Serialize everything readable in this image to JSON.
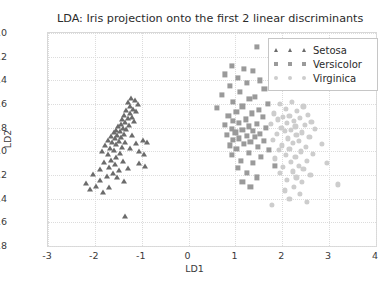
{
  "chart_data": {
    "type": "scatter",
    "title": "LDA: Iris projection onto the first 2 linear discriminants",
    "xlabel": "LD1",
    "ylabel": "LD2",
    "xlim": [
      -3,
      4
    ],
    "ylim": [
      -2.8,
      -1.0
    ],
    "xticks": [
      "-3",
      "-2",
      "-1",
      "0",
      "1",
      "2",
      "3",
      "4"
    ],
    "xtick_values": [
      -3,
      -2,
      -1,
      0,
      1,
      2,
      3,
      4
    ],
    "yticks": [
      "-1.0",
      "-1.2",
      "-1.4",
      "-1.6",
      "-1.8",
      "-2.0",
      "-2.2",
      "-2.4",
      "-2.6",
      "-2.8"
    ],
    "ytick_values": [
      -1.0,
      -1.2,
      -1.4,
      -1.6,
      -1.8,
      -2.0,
      -2.2,
      -2.4,
      -2.6,
      -2.8
    ],
    "grid": true,
    "legend_position": "top-right",
    "background_color": "#ffffff",
    "series": [
      {
        "name": "Setosa",
        "marker": "triangle",
        "color": "#6b6b6b",
        "points": [
          [
            -1.22,
            -1.55
          ],
          [
            -1.15,
            -1.57
          ],
          [
            -1.3,
            -1.58
          ],
          [
            -1.08,
            -1.6
          ],
          [
            -1.26,
            -1.62
          ],
          [
            -1.18,
            -1.64
          ],
          [
            -1.33,
            -1.65
          ],
          [
            -1.12,
            -1.66
          ],
          [
            -1.24,
            -1.68
          ],
          [
            -1.38,
            -1.69
          ],
          [
            -1.2,
            -1.71
          ],
          [
            -1.29,
            -1.72
          ],
          [
            -1.42,
            -1.73
          ],
          [
            -1.16,
            -1.74
          ],
          [
            -1.35,
            -1.75
          ],
          [
            -1.45,
            -1.77
          ],
          [
            -1.27,
            -1.78
          ],
          [
            -1.5,
            -1.79
          ],
          [
            -1.4,
            -1.8
          ],
          [
            -1.33,
            -1.81
          ],
          [
            -1.55,
            -1.82
          ],
          [
            -1.46,
            -1.83
          ],
          [
            -1.6,
            -1.84
          ],
          [
            -1.38,
            -1.85
          ],
          [
            -1.52,
            -1.86
          ],
          [
            -1.21,
            -1.86
          ],
          [
            -1.66,
            -1.87
          ],
          [
            -1.44,
            -1.88
          ],
          [
            -1.58,
            -1.89
          ],
          [
            -1.72,
            -1.9
          ],
          [
            -1.49,
            -1.91
          ],
          [
            -1.63,
            -1.92
          ],
          [
            -1.36,
            -1.92
          ],
          [
            -1.55,
            -1.94
          ],
          [
            -1.78,
            -1.95
          ],
          [
            -1.42,
            -1.96
          ],
          [
            -1.68,
            -1.97
          ],
          [
            -1.25,
            -1.97
          ],
          [
            -1.6,
            -1.99
          ],
          [
            -1.85,
            -2.0
          ],
          [
            -1.47,
            -2.01
          ],
          [
            -1.73,
            -2.02
          ],
          [
            -1.12,
            -1.93
          ],
          [
            -0.98,
            -1.9
          ],
          [
            -0.88,
            -1.92
          ],
          [
            -1.05,
            -2.0
          ],
          [
            -0.95,
            -2.02
          ],
          [
            -1.54,
            -2.05
          ],
          [
            -1.66,
            -2.07
          ],
          [
            -1.4,
            -2.08
          ],
          [
            -1.8,
            -2.09
          ],
          [
            -1.58,
            -2.11
          ],
          [
            -1.7,
            -2.13
          ],
          [
            -1.3,
            -2.14
          ],
          [
            -1.9,
            -2.15
          ],
          [
            -1.48,
            -2.16
          ],
          [
            -1.62,
            -2.18
          ],
          [
            -1.05,
            -2.1
          ],
          [
            -0.92,
            -2.12
          ],
          [
            -2.05,
            -2.19
          ],
          [
            -1.75,
            -2.21
          ],
          [
            -1.52,
            -2.22
          ],
          [
            -1.88,
            -2.24
          ],
          [
            -1.38,
            -2.25
          ],
          [
            -2.18,
            -2.27
          ],
          [
            -1.98,
            -2.29
          ],
          [
            -1.7,
            -2.3
          ],
          [
            -2.1,
            -2.32
          ],
          [
            -1.82,
            -2.34
          ],
          [
            -1.35,
            -2.55
          ]
        ]
      },
      {
        "name": "Versicolor",
        "marker": "square",
        "color": "#9a9a9a",
        "points": [
          [
            1.45,
            -1.12
          ],
          [
            0.92,
            -1.28
          ],
          [
            1.18,
            -1.3
          ],
          [
            1.38,
            -1.32
          ],
          [
            0.78,
            -1.35
          ],
          [
            1.05,
            -1.38
          ],
          [
            1.52,
            -1.4
          ],
          [
            1.25,
            -1.42
          ],
          [
            0.88,
            -1.45
          ],
          [
            1.62,
            -1.47
          ],
          [
            1.1,
            -1.5
          ],
          [
            0.72,
            -1.52
          ],
          [
            1.42,
            -1.54
          ],
          [
            1.3,
            -1.56
          ],
          [
            0.95,
            -1.58
          ],
          [
            1.7,
            -1.6
          ],
          [
            1.15,
            -1.62
          ],
          [
            0.6,
            -1.63
          ],
          [
            1.5,
            -1.65
          ],
          [
            1.02,
            -1.67
          ],
          [
            1.35,
            -1.68
          ],
          [
            0.85,
            -1.7
          ],
          [
            1.58,
            -1.71
          ],
          [
            1.22,
            -1.73
          ],
          [
            0.95,
            -1.74
          ],
          [
            1.08,
            -1.76
          ],
          [
            1.45,
            -1.77
          ],
          [
            0.78,
            -1.78
          ],
          [
            1.28,
            -1.79
          ],
          [
            1.65,
            -1.8
          ],
          [
            0.92,
            -1.81
          ],
          [
            1.15,
            -1.82
          ],
          [
            1.38,
            -1.83
          ],
          [
            1.0,
            -1.84
          ],
          [
            1.52,
            -1.85
          ],
          [
            0.82,
            -1.86
          ],
          [
            1.25,
            -1.87
          ],
          [
            1.42,
            -1.88
          ],
          [
            1.08,
            -1.89
          ],
          [
            0.95,
            -1.9
          ],
          [
            1.6,
            -1.91
          ],
          [
            1.32,
            -1.92
          ],
          [
            1.18,
            -1.94
          ],
          [
            0.88,
            -1.95
          ],
          [
            1.48,
            -1.96
          ],
          [
            1.02,
            -1.98
          ],
          [
            1.72,
            -1.99
          ],
          [
            1.28,
            -2.01
          ],
          [
            0.92,
            -2.03
          ],
          [
            1.55,
            -2.05
          ],
          [
            1.12,
            -2.08
          ],
          [
            1.38,
            -2.1
          ],
          [
            1.85,
            -2.12
          ],
          [
            1.05,
            -2.14
          ],
          [
            1.25,
            -2.18
          ],
          [
            1.45,
            -2.22
          ],
          [
            1.15,
            -2.26
          ],
          [
            1.32,
            -2.3
          ]
        ]
      },
      {
        "name": "Virginica",
        "marker": "circle",
        "color": "#cdcdcd",
        "points": [
          [
            2.2,
            -1.58
          ],
          [
            1.95,
            -1.6
          ],
          [
            2.45,
            -1.62
          ],
          [
            2.08,
            -1.64
          ],
          [
            2.32,
            -1.66
          ],
          [
            1.82,
            -1.68
          ],
          [
            2.55,
            -1.69
          ],
          [
            2.15,
            -1.7
          ],
          [
            2.02,
            -1.71
          ],
          [
            2.38,
            -1.72
          ],
          [
            1.9,
            -1.73
          ],
          [
            2.25,
            -1.74
          ],
          [
            2.62,
            -1.75
          ],
          [
            2.1,
            -1.76
          ],
          [
            1.75,
            -1.77
          ],
          [
            2.48,
            -1.78
          ],
          [
            2.28,
            -1.79
          ],
          [
            1.98,
            -1.8
          ],
          [
            2.7,
            -1.81
          ],
          [
            2.18,
            -1.82
          ],
          [
            2.05,
            -1.83
          ],
          [
            2.42,
            -1.84
          ],
          [
            1.88,
            -1.85
          ],
          [
            2.3,
            -1.86
          ],
          [
            2.58,
            -1.88
          ],
          [
            2.12,
            -1.89
          ],
          [
            1.8,
            -1.9
          ],
          [
            2.35,
            -1.91
          ],
          [
            2.22,
            -1.93
          ],
          [
            2.85,
            -1.94
          ],
          [
            2.0,
            -1.95
          ],
          [
            2.5,
            -1.96
          ],
          [
            2.15,
            -1.98
          ],
          [
            1.92,
            -1.99
          ],
          [
            2.4,
            -2.0
          ],
          [
            2.65,
            -2.02
          ],
          [
            2.08,
            -2.03
          ],
          [
            2.28,
            -2.05
          ],
          [
            1.85,
            -2.06
          ],
          [
            2.52,
            -2.08
          ],
          [
            2.18,
            -2.09
          ],
          [
            2.95,
            -2.1
          ],
          [
            2.35,
            -2.12
          ],
          [
            2.02,
            -2.13
          ],
          [
            2.45,
            -2.15
          ],
          [
            2.22,
            -2.17
          ],
          [
            1.95,
            -2.18
          ],
          [
            2.6,
            -2.2
          ],
          [
            2.3,
            -2.22
          ],
          [
            2.1,
            -2.24
          ],
          [
            2.42,
            -2.26
          ],
          [
            3.18,
            -2.28
          ],
          [
            2.25,
            -2.3
          ],
          [
            2.05,
            -2.33
          ],
          [
            2.38,
            -2.36
          ],
          [
            2.15,
            -2.4
          ],
          [
            2.52,
            -2.43
          ],
          [
            1.78,
            -2.45
          ]
        ]
      }
    ]
  }
}
